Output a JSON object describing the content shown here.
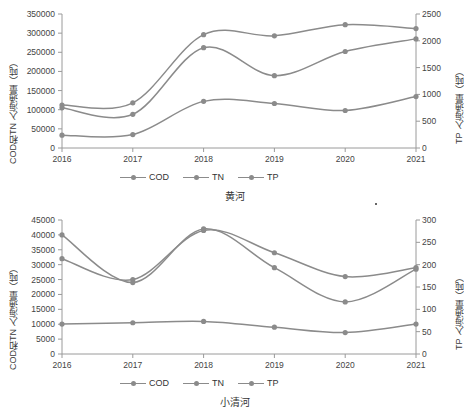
{
  "charts": [
    {
      "caption": "黄河",
      "ylabel_left": "COD和TN 入海通量（吨）",
      "ylabel_right": "TP 入海通量（吨）",
      "xticks": [
        "2016",
        "2017",
        "2018",
        "2019",
        "2020",
        "2021"
      ],
      "yticks_left": [
        "0",
        "50000",
        "100000",
        "150000",
        "200000",
        "250000",
        "300000",
        "350000"
      ],
      "yticks_right": [
        "0",
        "500",
        "1000",
        "1500",
        "2000",
        "2500"
      ],
      "legend": [
        "COD",
        "TN",
        "TP"
      ],
      "chart_data": {
        "type": "line",
        "title": "黄河",
        "xlabel": "",
        "ylabel": "COD和TN 入海通量（吨）",
        "ylabel_right": "TP 入海通量（吨）",
        "x": [
          2016,
          2017,
          2018,
          2019,
          2020,
          2021
        ],
        "ylim": [
          0,
          350000
        ],
        "ylim_right": [
          0,
          2500
        ],
        "grid": false,
        "legend_position": "bottom",
        "series": [
          {
            "name": "COD",
            "axis": "left",
            "values": [
              112000,
              118000,
              296000,
              293000,
              322000,
              312000
            ]
          },
          {
            "name": "TN",
            "axis": "left",
            "values": [
              105000,
              88000,
              262000,
              189000,
              252000,
              285000
            ]
          },
          {
            "name": "TP",
            "axis": "right",
            "values": [
              240,
              250,
              870,
              830,
              700,
              960
            ]
          }
        ]
      }
    },
    {
      "caption": "小清河",
      "ylabel_left": "COD和TN 入海通量（吨）",
      "ylabel_right": "TP 入海通量（吨）",
      "xticks": [
        "2016",
        "2017",
        "2018",
        "2019",
        "2020",
        "2021"
      ],
      "yticks_left": [
        "0",
        "5000",
        "10000",
        "15000",
        "20000",
        "25000",
        "30000",
        "35000",
        "40000",
        "45000"
      ],
      "yticks_right": [
        "0",
        "50",
        "100",
        "150",
        "200",
        "250",
        "300"
      ],
      "legend": [
        "COD",
        "TN",
        "TP"
      ],
      "chart_data": {
        "type": "line",
        "title": "小清河",
        "xlabel": "",
        "ylabel": "COD和TN 入海通量（吨）",
        "ylabel_right": "TP 入海通量（吨）",
        "x": [
          2016,
          2017,
          2018,
          2019,
          2020,
          2021
        ],
        "ylim": [
          0,
          45000
        ],
        "ylim_right": [
          0,
          300
        ],
        "grid": false,
        "legend_position": "bottom",
        "series": [
          {
            "name": "COD",
            "axis": "left",
            "values": [
              32000,
              25000,
              41500,
              34000,
              26000,
              29000
            ]
          },
          {
            "name": "TN",
            "axis": "left",
            "values": [
              40000,
              24000,
              42000,
              29000,
              17500,
              28500
            ]
          },
          {
            "name": "TP",
            "axis": "right",
            "values": [
              67,
              70,
              73,
              60,
              48,
              67
            ]
          }
        ]
      }
    }
  ],
  "colors": {
    "line": "#8b8b8b",
    "axis": "#9a9a9a",
    "text": "#333333"
  }
}
